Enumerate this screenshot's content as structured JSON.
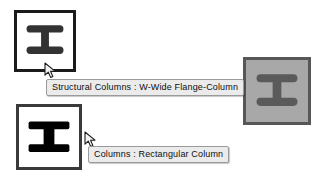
{
  "scene": {
    "background_color": "#ffffff",
    "description": "Revit family type icons with hover tooltips"
  },
  "icons": [
    {
      "id": "structural-column-w-wide-flange",
      "icon_name": "i-beam-column-icon",
      "state": "enabled",
      "style": "rounded",
      "border_color": "#1b1b1b",
      "fill_color": "#ffffff",
      "glyph_color": "#333333",
      "x": 14,
      "y": 10,
      "size": 62
    },
    {
      "id": "rectangular-column",
      "icon_name": "i-beam-column-icon",
      "state": "enabled",
      "style": "sharp",
      "border_color": "#3a3a3a",
      "fill_color": "#ffffff",
      "glyph_color": "#000000",
      "x": 16,
      "y": 104,
      "size": 66
    },
    {
      "id": "disabled-column",
      "icon_name": "i-beam-column-icon",
      "state": "disabled",
      "style": "rounded",
      "border_color": "#575757",
      "fill_color": "#a8a8a8",
      "glyph_color": "#5a5a5a",
      "x": 243,
      "y": 57,
      "size": 68
    }
  ],
  "tooltips": [
    {
      "id": "tooltip-structural-columns",
      "text": "Structural Columns : W-Wide Flange-Column",
      "x": 46,
      "y": 79,
      "background": "#ebebeb",
      "border": "#9a9a9a"
    },
    {
      "id": "tooltip-columns",
      "text": "Columns : Rectangular Column",
      "x": 88,
      "y": 146,
      "background": "#ebebeb",
      "border": "#9a9a9a"
    }
  ],
  "cursors": [
    {
      "id": "cursor-upper",
      "icon_name": "arrow-pointer-icon",
      "x": 44,
      "y": 62
    },
    {
      "id": "cursor-lower",
      "icon_name": "arrow-pointer-icon",
      "x": 84,
      "y": 131
    }
  ]
}
